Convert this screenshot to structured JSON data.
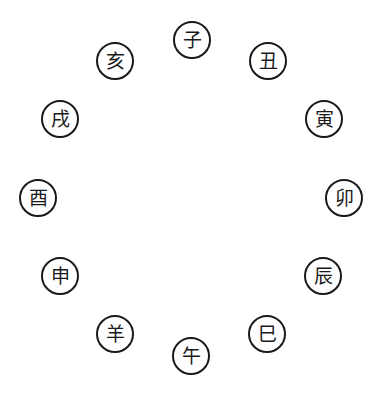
{
  "diagram": {
    "type": "circular arrangement of twelve Earthly Branches",
    "stroke_color": "#1a1a1a",
    "background": "#ffffff",
    "branches": [
      {
        "char": "子",
        "cx": 192,
        "cy": 40
      },
      {
        "char": "丑",
        "cx": 268,
        "cy": 61
      },
      {
        "char": "寅",
        "cx": 324,
        "cy": 119
      },
      {
        "char": "卯",
        "cx": 344,
        "cy": 198
      },
      {
        "char": "辰",
        "cx": 323,
        "cy": 276
      },
      {
        "char": "巳",
        "cx": 267,
        "cy": 334
      },
      {
        "char": "午",
        "cx": 191,
        "cy": 356
      },
      {
        "char": "羊",
        "cx": 115,
        "cy": 334
      },
      {
        "char": "申",
        "cx": 60,
        "cy": 276
      },
      {
        "char": "酉",
        "cx": 38,
        "cy": 198
      },
      {
        "char": "戌",
        "cx": 60,
        "cy": 119
      },
      {
        "char": "亥",
        "cx": 115,
        "cy": 61
      }
    ]
  }
}
